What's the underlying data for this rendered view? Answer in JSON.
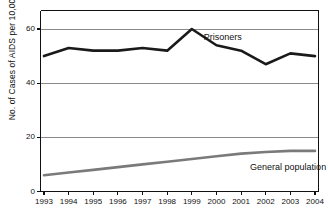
{
  "chart_data": {
    "type": "line",
    "title": "",
    "subtitle": "",
    "xlabel": "",
    "ylabel": "No. of Cases of AIDS per 10,000",
    "categories": [
      "1993",
      "1994",
      "1995",
      "1996",
      "1997",
      "1998",
      "1999",
      "2000",
      "2001",
      "2002",
      "2003",
      "2004"
    ],
    "x": [
      1993,
      1994,
      1995,
      1996,
      1997,
      1998,
      1999,
      2000,
      2001,
      2002,
      2003,
      2004
    ],
    "xlim": [
      1993,
      2004
    ],
    "ylim": [
      0,
      65
    ],
    "yticks": [
      0,
      20,
      40,
      60
    ],
    "ytick_labels": [
      "0",
      "20",
      "40",
      "60"
    ],
    "grid": true,
    "grid_axis": "y",
    "legend": "inline-annotations",
    "series": [
      {
        "name": "Prisoners",
        "color": "#1a1a1a",
        "width": 2.6,
        "values": [
          50,
          53,
          52,
          52,
          53,
          52,
          60,
          54,
          52,
          47,
          51,
          50
        ],
        "label_x": 2000,
        "label_y": 57
      },
      {
        "name": "General population",
        "color": "#7a7a7a",
        "width": 2.6,
        "values": [
          6,
          7,
          8,
          9,
          10,
          11,
          12,
          13,
          14,
          14.6,
          15,
          15
        ],
        "label_x": 2002,
        "label_y": 9
      }
    ],
    "annotations": [
      {
        "text": "Prisoners",
        "name": "prisoners-series-label"
      },
      {
        "text": "General population",
        "name": "general-population-series-label"
      }
    ],
    "axis_color": "#111111",
    "grid_color": "#8a8a8a",
    "background": "#ffffff"
  }
}
